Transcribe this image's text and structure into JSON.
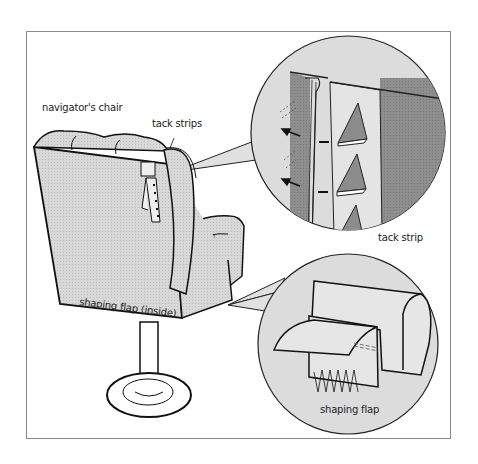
{
  "figure": {
    "labels": {
      "chair": "navigator's chair",
      "tack_strips": "tack strips",
      "tack_strip": "tack strip",
      "shaping_flap_inside": "shaping flap (inside)",
      "shaping_flap": "shaping flap"
    },
    "callouts": [
      {
        "name": "tack-strip-detail",
        "description": "magnified view of tack strip with triangular tacks"
      },
      {
        "name": "shaping-flap-detail",
        "description": "magnified view of arm with shaping flap stitched"
      }
    ],
    "colors": {
      "fabric_fill": "#d6d6d6",
      "dark_fill": "#8c8c8c",
      "lens_fill": "#dcdcdc",
      "line": "#1a1a1a",
      "frame": "#8a8a8a"
    }
  }
}
